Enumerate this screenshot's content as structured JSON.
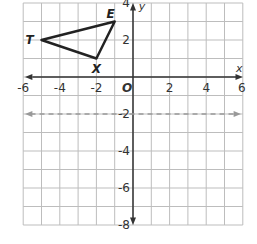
{
  "chart_data": {
    "type": "diagram",
    "title": "",
    "xlabel": "x",
    "ylabel": "y",
    "xlim": [
      -6,
      6
    ],
    "ylim": [
      -8,
      4
    ],
    "grid": true,
    "origin_label": "O",
    "x_tick_labels": [
      "-6",
      "-4",
      "-2",
      "2",
      "4",
      "6"
    ],
    "y_tick_labels": [
      "4",
      "2",
      "-2",
      "-4",
      "-6",
      "-8"
    ],
    "triangle": {
      "vertices": [
        {
          "name": "T",
          "x": -5,
          "y": 2
        },
        {
          "name": "E",
          "x": -1,
          "y": 3
        },
        {
          "name": "X",
          "x": -2,
          "y": 1
        }
      ]
    },
    "dashed_line": {
      "equation": "y = -2",
      "y": -2,
      "color": "#999999"
    }
  }
}
